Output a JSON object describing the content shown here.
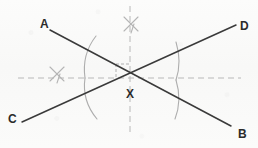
{
  "figure": {
    "background_color": "#fbfbfa",
    "line_color": "#3a3a3a",
    "construction_color": "#b3b3b3",
    "label_color": "#2b2b2b",
    "labels": [
      {
        "id": "label-a",
        "text": "A",
        "x": 40,
        "y": 18
      },
      {
        "id": "label-b",
        "text": "B",
        "x": 238,
        "y": 128
      },
      {
        "id": "label-c",
        "text": "C",
        "x": 8,
        "y": 113
      },
      {
        "id": "label-d",
        "text": "D",
        "x": 240,
        "y": 20
      },
      {
        "id": "label-x",
        "text": "X",
        "x": 126,
        "y": 88
      }
    ],
    "segments": [
      {
        "id": "segment-ab",
        "from": "A",
        "to": "B",
        "x1": 50,
        "y1": 30,
        "x2": 231,
        "y2": 126
      },
      {
        "id": "segment-cd",
        "from": "C",
        "to": "D",
        "x1": 22,
        "y1": 122,
        "x2": 236,
        "y2": 25
      }
    ],
    "intersection": {
      "id": "point-x",
      "label": "X",
      "x": 130,
      "y": 78
    },
    "dashed_lines": [
      {
        "id": "horizontal-bisector",
        "orientation": "horizontal",
        "x1": 18,
        "y1": 78,
        "x2": 241,
        "y2": 78
      },
      {
        "id": "vertical-bisector",
        "orientation": "vertical",
        "x1": 130,
        "y1": 6,
        "x2": 130,
        "y2": 136
      }
    ],
    "right_angle_marker": {
      "id": "right-angle-mark",
      "x": 114,
      "y": 62,
      "size": 13
    },
    "arcs": [
      {
        "id": "arc-left-upper",
        "d": "M 96 36 C 85 50 83 64 85 78"
      },
      {
        "id": "arc-left-lower",
        "d": "M 85 78 C 83 92 86 106 97 119"
      },
      {
        "id": "arc-right-upper",
        "d": "M 176 42 C 180 55 180 68 176 80"
      },
      {
        "id": "arc-right-lower",
        "d": "M 176 80 C 180 93 180 106 175 119"
      }
    ],
    "cross_marks": [
      {
        "id": "cross-mark-top",
        "cx": 131,
        "cy": 24,
        "r": 9
      },
      {
        "id": "cross-mark-left",
        "cx": 57,
        "cy": 74,
        "r": 9
      }
    ]
  }
}
